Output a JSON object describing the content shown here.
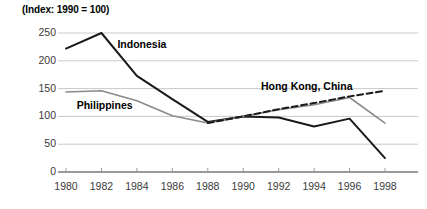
{
  "chart_data": {
    "type": "line",
    "title": "(Index: 1990 = 100)",
    "xlabel": "",
    "ylabel": "",
    "x": [
      1980,
      1982,
      1984,
      1986,
      1988,
      1990,
      1992,
      1994,
      1996,
      1998
    ],
    "xtick_labels": [
      "1980",
      "1982",
      "1984",
      "1986",
      "1988",
      "1990",
      "1992",
      "1994",
      "1996",
      "1998"
    ],
    "ytick_labels": [
      "0",
      "50",
      "100",
      "150",
      "200",
      "250"
    ],
    "yticks": [
      0,
      50,
      100,
      150,
      200,
      250
    ],
    "ylim": [
      0,
      262
    ],
    "xlim": [
      1980,
      1998
    ],
    "grid": true,
    "grid_axis": "y",
    "legend": "inline-labels",
    "series": [
      {
        "name": "Indonesia",
        "style": "solid",
        "color": "#1a1a1a",
        "width": 2.0,
        "label_x": 1982.9,
        "label_y": 228,
        "values": [
          222,
          250,
          173,
          131,
          90,
          100,
          98,
          82,
          96,
          25
        ]
      },
      {
        "name": "Philippines",
        "style": "solid",
        "color": "#8a8a8a",
        "width": 1.6,
        "label_x": 1980.6,
        "label_y": 118,
        "values": [
          144,
          146,
          128,
          101,
          88,
          100,
          112,
          121,
          134,
          88
        ]
      },
      {
        "name": "Hong Kong, China",
        "style": "dashed",
        "color": "#1a1a1a",
        "width": 2.0,
        "label_x": 1991.0,
        "label_y": 152,
        "values": [
          null,
          null,
          null,
          null,
          88,
          100,
          113,
          124,
          136,
          146
        ]
      }
    ]
  }
}
